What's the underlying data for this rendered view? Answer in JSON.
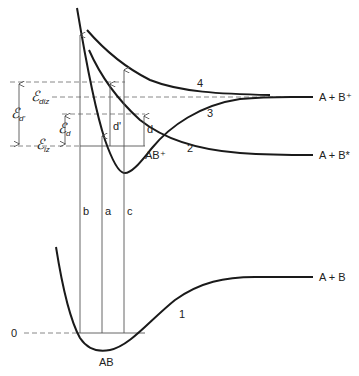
{
  "diagram": {
    "curves": [
      {
        "id": "1",
        "label": "1",
        "state": "AB ground state",
        "asymptote": "A + B"
      },
      {
        "id": "2",
        "label": "2",
        "state": "AB+ bound ion",
        "asymptote": "A + B*"
      },
      {
        "id": "3",
        "label": "3",
        "state": "repulsive/upper ion",
        "asymptote": "A + B⁺"
      },
      {
        "id": "4",
        "label": "4",
        "state": "repulsive ion",
        "asymptote": "A + B⁺"
      }
    ],
    "asymptote_labels": {
      "upper": "A + B⁺",
      "middle": "A + B*",
      "lower": "A + B"
    },
    "well_labels": {
      "ion": "AB⁺",
      "neutral": "AB"
    },
    "transitions": [
      {
        "label": "b"
      },
      {
        "label": "a"
      },
      {
        "label": "c"
      },
      {
        "label": "d'"
      },
      {
        "label": "d"
      }
    ],
    "energy_levels": {
      "zero": "0",
      "e_iz_main": "ℰ",
      "e_iz_sub": "iz",
      "e_diz_main": "ℰ",
      "e_diz_sub": "diz",
      "e_d_main": "ℰ",
      "e_d_sub": "d",
      "e_dp_main": "ℰ",
      "e_dp_sub": "d'"
    },
    "colors": {
      "curve": "#1a1a1a",
      "dashed": "#888888",
      "arrow": "#555555"
    }
  }
}
